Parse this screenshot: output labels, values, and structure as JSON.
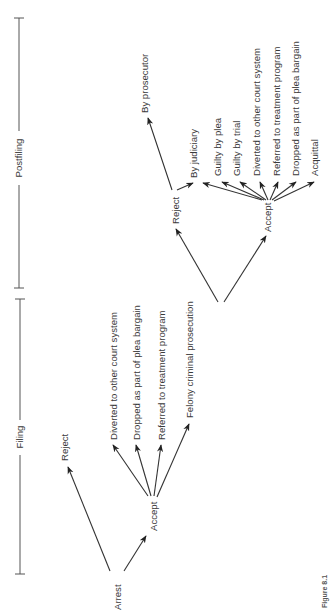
{
  "figure": {
    "label": "Figure 8.1",
    "orientation": "rotated-90-ccw"
  },
  "phases": [
    {
      "id": "filing",
      "label": "Filing"
    },
    {
      "id": "postfiling",
      "label": "Postfiling"
    }
  ],
  "nodes": {
    "arrest": "Arrest",
    "arrest_reject": "Reject",
    "filing_accept": "Accept",
    "filing_outcomes": [
      "Diverted to other court system",
      "Dropped as part of plea bargain",
      "Referred to treatment program",
      "Felony criminal prosecution"
    ],
    "post_reject": "Reject",
    "post_reject_outcomes": [
      "By prosecutor",
      "By judiciary"
    ],
    "post_accept": "Accept",
    "post_accept_outcomes": [
      "Guilty by plea",
      "Guilty by trial",
      "Diverted to other court system",
      "Referred to treatment program",
      "Dropped as part of plea bargain",
      "Acquittal"
    ]
  },
  "edges": [
    [
      "Arrest",
      "Reject"
    ],
    [
      "Arrest",
      "Accept"
    ],
    [
      "Accept",
      "Diverted to other court system"
    ],
    [
      "Accept",
      "Dropped as part of plea bargain"
    ],
    [
      "Accept",
      "Referred to treatment program"
    ],
    [
      "Accept",
      "Felony criminal prosecution"
    ],
    [
      "Felony criminal prosecution",
      "Reject"
    ],
    [
      "Felony criminal prosecution",
      "Accept"
    ],
    [
      "Reject",
      "By prosecutor"
    ],
    [
      "Reject",
      "By judiciary"
    ],
    [
      "Accept",
      "Guilty by plea"
    ],
    [
      "Accept",
      "Guilty by trial"
    ],
    [
      "Accept",
      "Diverted to other court system"
    ],
    [
      "Accept",
      "Referred to treatment program"
    ],
    [
      "Accept",
      "Dropped as part of plea bargain"
    ],
    [
      "Accept",
      "Acquittal"
    ]
  ]
}
